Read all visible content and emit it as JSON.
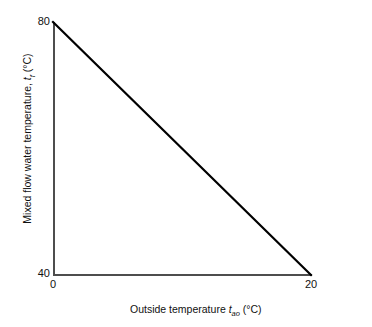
{
  "chart_data": {
    "type": "line",
    "title": "",
    "xlabel_text": "Outside temperature",
    "xlabel_symbol": "t",
    "xlabel_subscript": "ao",
    "xlabel_units": "(°C)",
    "ylabel_text": "Mixed flow water temperature,",
    "ylabel_symbol": "t",
    "ylabel_subscript": "f",
    "ylabel_units": "(°C)",
    "x": [
      0,
      20
    ],
    "y": [
      80,
      40
    ],
    "xlim": [
      0,
      20
    ],
    "ylim": [
      40,
      80
    ],
    "xticks": [
      "0",
      "20"
    ],
    "yticks": [
      "40",
      "80"
    ],
    "grid": false,
    "legend": null,
    "series": [
      {
        "name": "Mixed flow water temperature",
        "x": [
          0,
          20
        ],
        "values": [
          80,
          40
        ]
      }
    ],
    "line_color": "#000000",
    "axis_color": "#4d4d4d",
    "background": "#ffffff"
  },
  "axes": {
    "y": {
      "tick_top": "80",
      "tick_bottom": "40"
    },
    "x": {
      "tick_left": "0",
      "tick_right": "20"
    }
  }
}
